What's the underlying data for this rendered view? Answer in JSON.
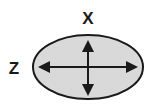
{
  "diagram": {
    "type": "ellipse-axes",
    "labels": {
      "x_axis": "X",
      "z_axis": "Z"
    },
    "colors": {
      "ellipse_fill": "#d9d9d9",
      "stroke": "#1a1a1a",
      "background": "#ffffff"
    },
    "arrows": [
      {
        "name": "vertical",
        "direction": "bidirectional",
        "axis": "X"
      },
      {
        "name": "horizontal",
        "direction": "bidirectional",
        "axis": "Z"
      }
    ]
  }
}
